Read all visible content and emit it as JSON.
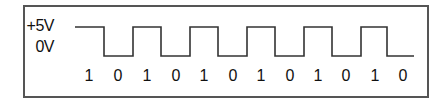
{
  "diagram": {
    "levels": {
      "high_label": "+5V",
      "low_label": "0V"
    },
    "bits": [
      "1",
      "0",
      "1",
      "0",
      "1",
      "0",
      "1",
      "0",
      "1",
      "0",
      "1",
      "0"
    ],
    "bit_label_x": [
      89,
      118,
      147,
      176,
      204,
      233,
      261,
      290,
      318,
      346,
      375,
      403
    ],
    "waveform": {
      "start_x": 75,
      "end_x": 414,
      "high_y": 27,
      "low_y": 56,
      "edges_x": [
        104,
        133,
        161,
        190,
        218,
        247,
        275,
        304,
        332,
        361,
        387
      ],
      "start_level": "high",
      "stroke_color": "#333333"
    },
    "frame_color": "#555555"
  }
}
